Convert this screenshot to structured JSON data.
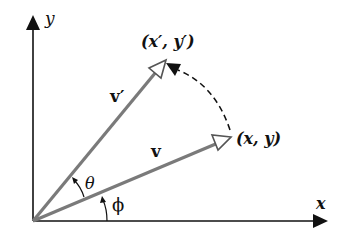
{
  "diagram": {
    "type": "vector-rotation",
    "axes": {
      "x_label": "x",
      "y_label": "y"
    },
    "vectors": [
      {
        "name": "v",
        "label": "v",
        "endpoint_label": "(x, y)"
      },
      {
        "name": "v-prime",
        "label": "v′",
        "endpoint_label": "(x′, y′)"
      }
    ],
    "angles": [
      {
        "name": "theta",
        "label": "θ",
        "description": "rotation angle between v and v′"
      },
      {
        "name": "phi",
        "label": "ϕ",
        "description": "angle between x-axis and v"
      }
    ],
    "colors": {
      "axes": "#111111",
      "vectors": "#7a7a7a",
      "rotation_arc": "#111111"
    }
  }
}
